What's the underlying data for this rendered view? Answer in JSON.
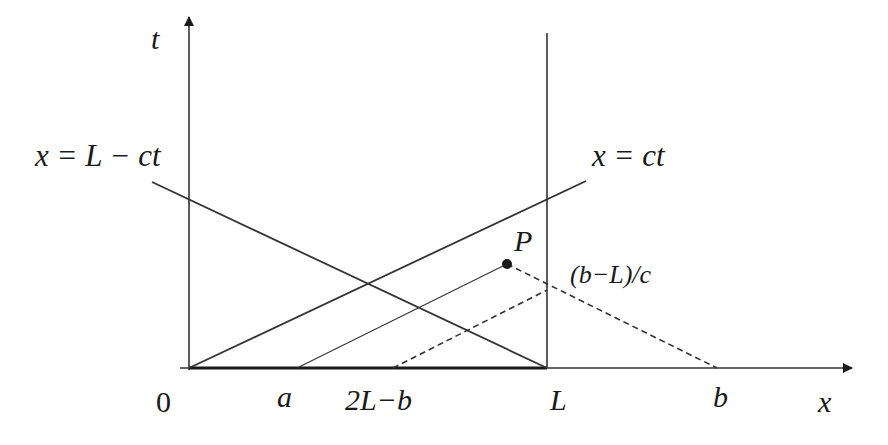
{
  "diagram": {
    "axes": {
      "x_label": "x",
      "t_label": "t"
    },
    "lines": {
      "left_char": "x = L − ct",
      "right_char": "x = ct"
    },
    "point": {
      "label": "P"
    },
    "annotation": "(b−L)/c",
    "ticks": {
      "origin": "0",
      "a": "a",
      "two_l_minus_b": "2L−b",
      "L": "L",
      "b": "b"
    }
  }
}
